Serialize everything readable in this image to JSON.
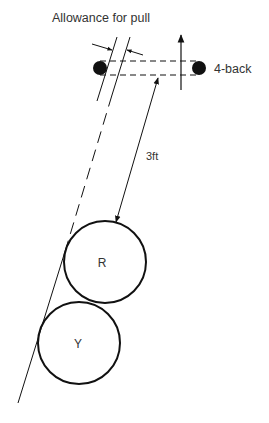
{
  "diagram": {
    "title_label": "Allowance for pull",
    "back_label": "4-back",
    "distance_label": "3ft",
    "ball_red_label": "R",
    "ball_yellow_label": "Y"
  },
  "colors": {
    "ink": "#111111",
    "text": "#333333",
    "background": "#ffffff"
  }
}
